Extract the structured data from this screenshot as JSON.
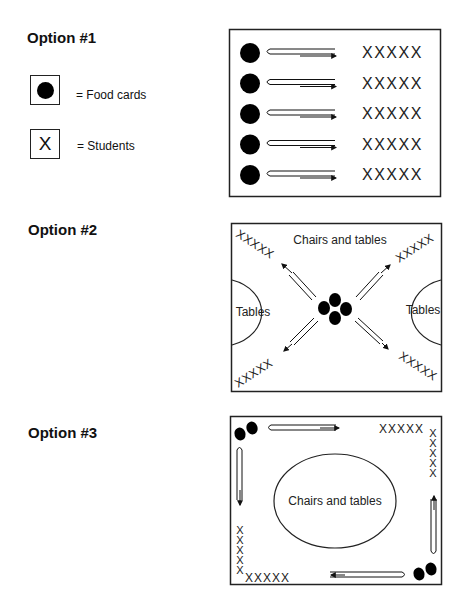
{
  "options": [
    {
      "title": "Option #1"
    },
    {
      "title": "Option #2"
    },
    {
      "title": "Option #3"
    }
  ],
  "legend": {
    "food_cards": {
      "icon": "filled-circle",
      "label": "= Food cards"
    },
    "students": {
      "icon": "x-mark",
      "glyph": "X",
      "label": "= Students"
    }
  },
  "diagram1": {
    "rows": 5,
    "students_row": "XXXXX"
  },
  "diagram2": {
    "top_label": "Chairs and tables",
    "left_label": "Tables",
    "right_label": "Tables",
    "students_group": "XXXXX",
    "food_cards_center": 4
  },
  "diagram3": {
    "center_label": "Chairs and tables",
    "students_group": "XXXXX",
    "food_card_pairs": 2
  },
  "colors": {
    "ink": "#111111",
    "background": "#ffffff"
  }
}
